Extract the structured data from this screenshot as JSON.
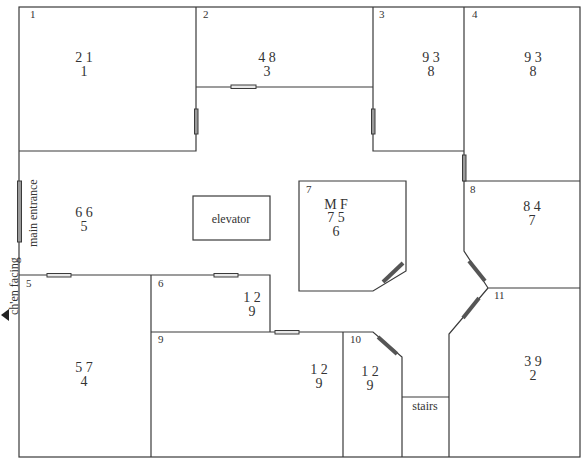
{
  "rooms": [
    {
      "id": "1",
      "number": "1",
      "top": "2 1",
      "bottom": "1"
    },
    {
      "id": "2",
      "number": "2",
      "top": "4 8",
      "bottom": "3"
    },
    {
      "id": "3",
      "number": "3",
      "top": "9 3",
      "bottom": "8"
    },
    {
      "id": "4",
      "number": "4",
      "top": "9 3",
      "bottom": "8"
    },
    {
      "id": "5",
      "number": "5",
      "top": "5 7",
      "bottom": "4"
    },
    {
      "id": "6",
      "number": "6",
      "top": "1 2",
      "bottom": "9"
    },
    {
      "id": "7",
      "number": "7",
      "header": "M F",
      "top": "7 5",
      "bottom": "6"
    },
    {
      "id": "8",
      "number": "8",
      "top": "8 4",
      "bottom": "7"
    },
    {
      "id": "9",
      "number": "9",
      "top": "1 2",
      "bottom": "9"
    },
    {
      "id": "10",
      "number": "10",
      "top": "1 2",
      "bottom": "9"
    },
    {
      "id": "11",
      "number": "11",
      "top": "3 9",
      "bottom": "2"
    }
  ],
  "hall": {
    "top": "6 6",
    "bottom": "5"
  },
  "labels": {
    "elevator": "elevator",
    "stairs": "stairs",
    "main_entrance": "main entrance",
    "facing": "ch'en facing"
  }
}
